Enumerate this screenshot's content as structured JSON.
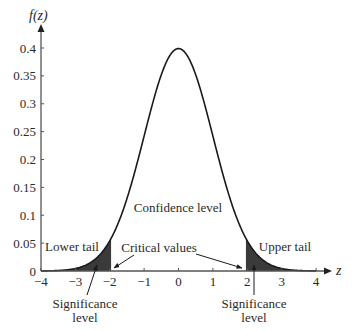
{
  "chart_data": {
    "type": "area",
    "title": "",
    "subtitle": "Standard normal density with two-tailed rejection regions",
    "xlabel": "z",
    "ylabel": "f(z)",
    "xlim": [
      -4,
      4
    ],
    "ylim": [
      0,
      0.4
    ],
    "grid": false,
    "legend": null,
    "x_ticks": [
      -4,
      -3,
      -2,
      -1,
      0,
      1,
      2,
      3,
      4
    ],
    "x_tick_labels": [
      "−4",
      "−3",
      "−2",
      "−1",
      "0",
      "1",
      "2",
      "3",
      "4"
    ],
    "y_ticks": [
      0,
      0.05,
      0.1,
      0.15,
      0.2,
      0.25,
      0.3,
      0.35,
      0.4
    ],
    "y_tick_labels": [
      "0",
      "0.05",
      "0.1",
      "0.15",
      "0.2",
      "0.25",
      "0.3",
      "0.35",
      "0.4"
    ],
    "series": [
      {
        "name": "f(z) standard normal pdf",
        "x": [
          -4,
          -3.5,
          -3,
          -2.5,
          -2,
          -1.5,
          -1,
          -0.5,
          0,
          0.5,
          1,
          1.5,
          2,
          2.5,
          3,
          3.5,
          4
        ],
        "values": [
          0.0001,
          0.0009,
          0.0044,
          0.0175,
          0.054,
          0.1295,
          0.242,
          0.3521,
          0.3989,
          0.3521,
          0.242,
          0.1295,
          0.054,
          0.0175,
          0.0044,
          0.0009,
          0.0001
        ]
      }
    ],
    "shaded_regions": [
      {
        "name": "Lower tail",
        "from": -4,
        "to": -1.96,
        "color": "#3a3a3a"
      },
      {
        "name": "Upper tail",
        "from": 1.96,
        "to": 4,
        "color": "#3a3a3a"
      }
    ],
    "critical_values": [
      -1.96,
      1.96
    ],
    "annotations": [
      {
        "text": "Confidence level",
        "x": 0,
        "y": 0.115
      },
      {
        "text": "Lower tail",
        "x": -3.1,
        "y": 0.04
      },
      {
        "text": "Upper tail",
        "x": 3.1,
        "y": 0.04
      },
      {
        "text": "Critical values",
        "x": -0.6,
        "y": 0.035
      },
      {
        "text": "Significance level",
        "x": -2.4,
        "y": -0.045,
        "position": "below axis"
      },
      {
        "text": "Significance level",
        "x": 2.2,
        "y": -0.045,
        "position": "below axis"
      }
    ]
  },
  "labels": {
    "y_axis_title": "f(z)",
    "x_axis_title": "z",
    "confidence": "Confidence level",
    "lower_tail": "Lower tail",
    "upper_tail": "Upper tail",
    "critical_values": "Critical values",
    "significance_line1": "Significance",
    "significance_line2": "level"
  },
  "colors": {
    "curve": "#1a1a1a",
    "axis": "#555555",
    "tail_fill": "#3a3a3a",
    "text": "#2a2a2a"
  }
}
